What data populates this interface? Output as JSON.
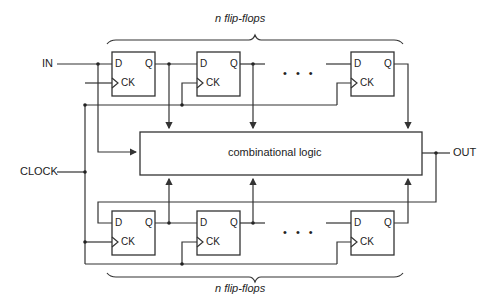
{
  "diagram": {
    "top_brace_label": "n flip-flops",
    "bottom_brace_label": "n flip-flops",
    "inputs": {
      "in": "IN",
      "clock": "CLOCK"
    },
    "output": "OUT",
    "logic_block": "combinational logic",
    "ellipsis": "• • •",
    "flip_flop_pins": {
      "d": "D",
      "q": "Q",
      "ck": "CK"
    },
    "top_flip_flops": [
      {
        "d": "D",
        "q": "Q",
        "ck": "CK"
      },
      {
        "d": "D",
        "q": "Q",
        "ck": "CK"
      },
      {
        "d": "D",
        "q": "Q",
        "ck": "CK"
      }
    ],
    "bottom_flip_flops": [
      {
        "d": "D",
        "q": "Q",
        "ck": "CK"
      },
      {
        "d": "D",
        "q": "Q",
        "ck": "CK"
      },
      {
        "d": "D",
        "q": "Q",
        "ck": "CK"
      }
    ]
  }
}
